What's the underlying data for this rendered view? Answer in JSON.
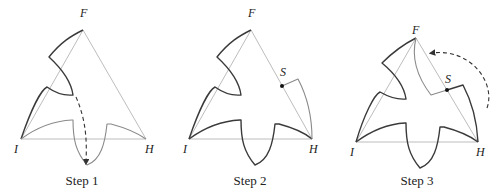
{
  "figure": {
    "panels": [
      {
        "caption": "Step 1",
        "vertices": {
          "top": "F",
          "left": "I",
          "right": "H"
        },
        "arrow": "dashed arrow rotating top-left notch down to bottom tooth"
      },
      {
        "caption": "Step 2",
        "vertices": {
          "top": "F",
          "left": "I",
          "right": "H"
        },
        "point": "S"
      },
      {
        "caption": "Step 3",
        "vertices": {
          "top": "F",
          "left": "I",
          "right": "H"
        },
        "point": "S",
        "arrow": "dashed arrow rotating right tab up toward F"
      }
    ]
  },
  "colors": {
    "triangle": "#bdbdbd",
    "curve_dark": "#3a3a3a",
    "curve_gray": "#8a8a8a"
  }
}
